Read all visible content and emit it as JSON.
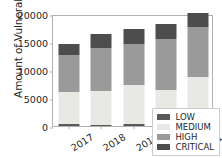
{
  "chart_data": {
    "type": "bar",
    "stacked": true,
    "title": "",
    "xlabel": "",
    "ylabel": "Amount of Vulnerabilities",
    "categories": [
      "2017",
      "2018",
      "2019",
      "2020",
      "2021"
    ],
    "ylim": [
      0,
      20000
    ],
    "yticks": [
      0,
      5000,
      10000,
      15000,
      20000
    ],
    "ytick_labels": [
      "0",
      "5000",
      "10000",
      "15000",
      "20000"
    ],
    "grid": false,
    "legend_position": "lower right",
    "series": [
      {
        "name": "LOW",
        "color": "#595959",
        "values": [
          300,
          250,
          300,
          400,
          400
        ]
      },
      {
        "name": "MEDIUM",
        "color": "#e8e8e4",
        "values": [
          5700,
          6050,
          7100,
          6000,
          8400
        ]
      },
      {
        "name": "HIGH",
        "color": "#9a9a9a",
        "values": [
          6600,
          7600,
          7200,
          9200,
          8800
        ]
      },
      {
        "name": "CRITICAL",
        "color": "#4d4d4d",
        "values": [
          2100,
          2600,
          2700,
          2700,
          2500
        ]
      }
    ],
    "totals": [
      14700,
      16500,
      17300,
      18300,
      20100
    ]
  },
  "legend": {
    "items": [
      {
        "label": "LOW",
        "color": "#595959"
      },
      {
        "label": "MEDIUM",
        "color": "#e8e8e4"
      },
      {
        "label": "HIGH",
        "color": "#9a9a9a"
      },
      {
        "label": "CRITICAL",
        "color": "#4d4d4d"
      }
    ]
  }
}
